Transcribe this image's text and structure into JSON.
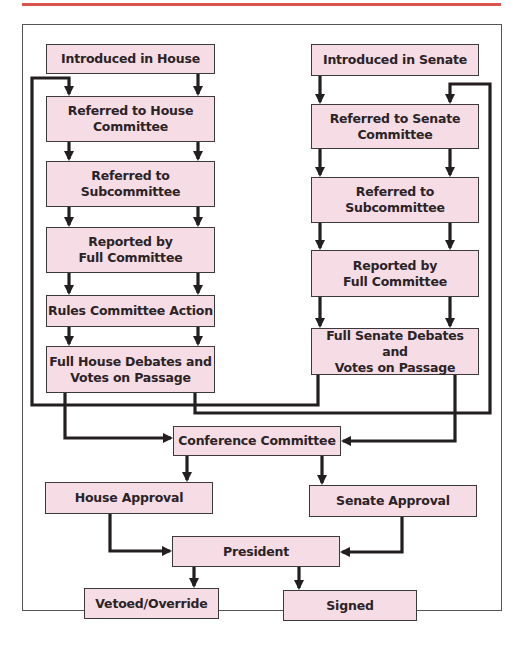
{
  "diagram": {
    "colors": {
      "accent_rule": "#d9534f",
      "box_fill": "#f6dde5",
      "box_border": "#3a3a3a",
      "arrow": "#231f20"
    },
    "house": {
      "introduced": "Introduced in House",
      "committee_l1": "Referred to House",
      "committee_l2": "Committee",
      "sub_l1": "Referred to",
      "sub_l2": "Subcommittee",
      "reported_l1": "Reported by",
      "reported_l2": "Full Committee",
      "rules": "Rules Committee Action",
      "debate_l1": "Full House Debates and",
      "debate_l2": "Votes on Passage"
    },
    "senate": {
      "introduced": "Introduced in Senate",
      "committee_l1": "Referred to Senate",
      "committee_l2": "Committee",
      "sub_l1": "Referred to",
      "sub_l2": "Subcommittee",
      "reported_l1": "Reported by",
      "reported_l2": "Full Committee",
      "debate_l1": "Full Senate Debates and",
      "debate_l2": "Votes on Passage"
    },
    "conference": "Conference Committee",
    "house_approval": "House Approval",
    "senate_approval": "Senate Approval",
    "president": "President",
    "vetoed": "Vetoed/Override",
    "signed": "Signed"
  }
}
